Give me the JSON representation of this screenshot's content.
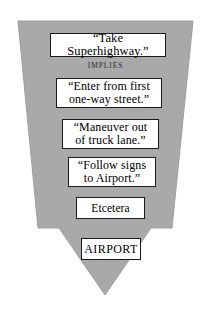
{
  "diagram": {
    "type": "downward-arrow-flow",
    "arrow_color": "#a9a9a9",
    "arrow_outline_color": "#9a9a9a",
    "background_color": "#ffffff",
    "box_fill_color": "#ffffff",
    "box_border_color": "#1a1a1a",
    "text_color": "#000000",
    "connector_label": "IMPLIES",
    "steps": [
      {
        "id": "step-1",
        "text": "“Take Superhighway.”"
      },
      {
        "id": "step-2",
        "text": "“Enter from first\none-way street.”"
      },
      {
        "id": "step-3",
        "text": "“Maneuver out\nof truck lane.”"
      },
      {
        "id": "step-4",
        "text": "“Follow signs\nto Airport.”"
      },
      {
        "id": "step-5",
        "text": "Etcetera"
      },
      {
        "id": "step-6",
        "text": "AIRPORT"
      }
    ]
  }
}
